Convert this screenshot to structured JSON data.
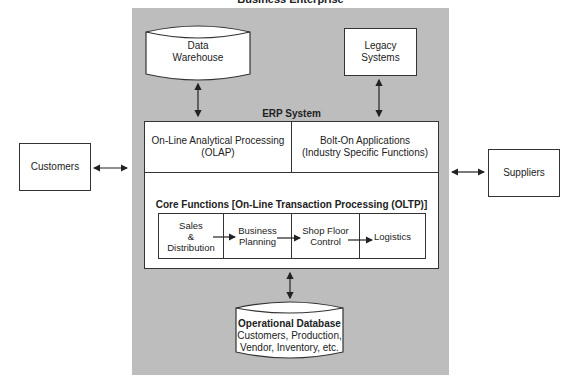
{
  "title": "Business Enterprise",
  "data_warehouse": {
    "line1": "Data",
    "line2": "Warehouse"
  },
  "legacy": {
    "line1": "Legacy",
    "line2": "Systems"
  },
  "erp": {
    "label": "ERP System",
    "olap": {
      "line1": "On-Line Analytical Processing",
      "line2": "(OLAP)"
    },
    "bolt_on": {
      "line1": "Bolt-On Applications",
      "line2": "(Industry Specific Functions)"
    },
    "core_label": "Core Functions [On-Line Transaction Processing (OLTP)]",
    "core_cells": [
      {
        "lines": [
          "Sales",
          "&",
          "Distribution"
        ]
      },
      {
        "lines": [
          "Business",
          "Planning"
        ]
      },
      {
        "lines": [
          "Shop Floor",
          "Control"
        ]
      },
      {
        "lines": [
          "Logistics"
        ]
      }
    ]
  },
  "operational_db": {
    "title": "Operational Database",
    "line1": "Customers, Production,",
    "line2": "Vendor, Inventory, etc."
  },
  "customers": "Customers",
  "suppliers": "Suppliers",
  "colors": {
    "panel": "#bdbdbd",
    "line": "#333333",
    "box": "#ffffff"
  }
}
